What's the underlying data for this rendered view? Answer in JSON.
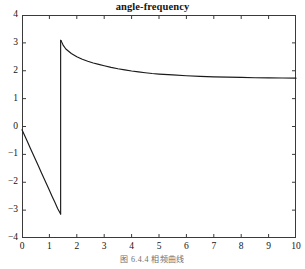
{
  "chart_data": {
    "type": "line",
    "title": "angle-frequency",
    "xlabel": "",
    "ylabel": "",
    "xlim": [
      0,
      10
    ],
    "ylim": [
      -4,
      4
    ],
    "xticks": [
      0,
      1,
      2,
      3,
      4,
      5,
      6,
      7,
      8,
      9,
      10
    ],
    "yticks": [
      -4,
      -3,
      -2,
      -1,
      0,
      1,
      2,
      3,
      4
    ],
    "grid": false,
    "legend": null,
    "line_color": "#1a1a1a",
    "series": [
      {
        "name": "phase",
        "x": [
          0.0,
          0.1,
          0.2,
          0.3,
          0.4,
          0.5,
          0.6,
          0.7,
          0.8,
          0.9,
          1.0,
          1.1,
          1.2,
          1.3,
          1.4,
          1.41
        ],
        "values": [
          -0.12,
          -0.33,
          -0.55,
          -0.77,
          -0.99,
          -1.2,
          -1.42,
          -1.64,
          -1.86,
          -2.07,
          -2.29,
          -2.51,
          -2.72,
          -2.94,
          -3.12,
          -3.14
        ]
      },
      {
        "name": "phase-wrapped",
        "x": [
          1.42,
          1.5,
          1.6,
          1.8,
          2.0,
          2.2,
          2.4,
          2.6,
          2.8,
          3.0,
          3.25,
          3.5,
          3.75,
          4.0,
          4.25,
          4.5,
          4.75,
          5.0,
          5.5,
          6.0,
          6.5,
          7.0,
          7.5,
          8.0,
          8.5,
          9.0,
          9.5,
          10.0
        ],
        "values": [
          3.09,
          2.92,
          2.78,
          2.62,
          2.5,
          2.41,
          2.34,
          2.28,
          2.23,
          2.18,
          2.12,
          2.07,
          2.03,
          1.99,
          1.96,
          1.93,
          1.9,
          1.88,
          1.85,
          1.82,
          1.8,
          1.78,
          1.77,
          1.76,
          1.75,
          1.745,
          1.74,
          1.735
        ]
      }
    ],
    "annotations": [
      {
        "label": "jump-discontinuity",
        "x": 1.41,
        "from": -3.14,
        "to": 3.09
      }
    ]
  },
  "caption": {
    "text": "图 6.4.4  相频曲线"
  }
}
